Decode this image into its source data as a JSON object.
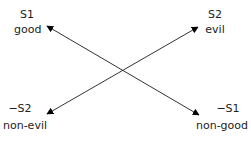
{
  "diagram": {
    "type": "semiotic-square",
    "nodes": {
      "top_left": {
        "symbol": "S1",
        "label": "good"
      },
      "top_right": {
        "symbol": "S2",
        "label": "evil"
      },
      "bottom_left": {
        "symbol": "−S2",
        "label": "non-evil"
      },
      "bottom_right": {
        "symbol": "−S1",
        "label": "non-good"
      }
    },
    "edges": [
      {
        "from": "bottom_right",
        "to": "top_left",
        "style": "double-arrow"
      },
      {
        "from": "top_right",
        "to": "bottom_left",
        "style": "double-arrow"
      }
    ],
    "colors": {
      "line": "#333333",
      "arrowhead": "#000000",
      "text": "#222222"
    }
  }
}
